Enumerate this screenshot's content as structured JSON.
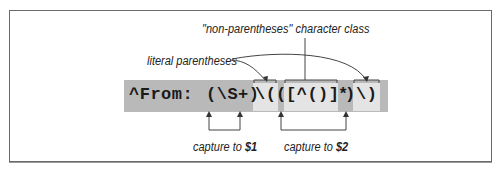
{
  "diagram": {
    "regex": {
      "prefix": "^From:",
      "capture1": "(\\S+)",
      "literal_open": "\\(",
      "capture2_open": "(",
      "char_class": "[^()]",
      "star": "*",
      "capture2_close": ")",
      "literal_close": "\\)"
    },
    "annotations": {
      "char_class_label": "\"non-parentheses\" character class",
      "literal_parens_label": "literal parentheses",
      "capture1_label_prefix": "capture to ",
      "capture1_var": "$1",
      "capture2_label_prefix": "capture to ",
      "capture2_var": "$2"
    },
    "colors": {
      "band": "#b9b9b9",
      "highlight": "#e4e4e4",
      "text": "#1a1a1a",
      "line": "#444444"
    }
  }
}
